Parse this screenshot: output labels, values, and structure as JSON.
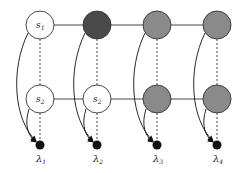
{
  "diagram": {
    "type": "graphical-model",
    "colors": {
      "white_node": "#ffffff",
      "dark_node": "#4a4a4a",
      "gray_node": "#8a8a8a",
      "observed_dot": "#111111",
      "edge": "#333333"
    },
    "columns": [
      {
        "top": {
          "label": "s",
          "sub": "1",
          "fill": "white"
        },
        "bottom": {
          "label": "s",
          "sub": "2",
          "fill": "white"
        },
        "lambda": {
          "label": "λ",
          "sub": "1"
        }
      },
      {
        "top": {
          "label": "",
          "sub": "",
          "fill": "dark"
        },
        "bottom": {
          "label": "s",
          "sub": "2",
          "fill": "white"
        },
        "lambda": {
          "label": "λ",
          "sub": "2"
        }
      },
      {
        "top": {
          "label": "",
          "sub": "",
          "fill": "gray"
        },
        "bottom": {
          "label": "",
          "sub": "",
          "fill": "gray"
        },
        "lambda": {
          "label": "λ",
          "sub": "3"
        }
      },
      {
        "top": {
          "label": "",
          "sub": "",
          "fill": "gray"
        },
        "bottom": {
          "label": "",
          "sub": "",
          "fill": "gray"
        },
        "lambda": {
          "label": "λ",
          "sub": "4"
        }
      }
    ]
  }
}
